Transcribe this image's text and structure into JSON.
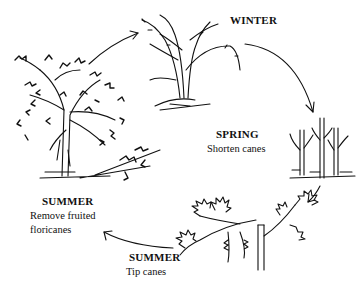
{
  "diagram": {
    "type": "cycle",
    "stages": [
      {
        "id": "winter",
        "title": "WINTER",
        "caption": ""
      },
      {
        "id": "spring",
        "title": "SPRING",
        "caption": "Shorten canes"
      },
      {
        "id": "summer-tip",
        "title": "SUMMER",
        "caption": "Tip canes"
      },
      {
        "id": "summer-remove",
        "title": "SUMMER",
        "caption_line1": "Remove fruited",
        "caption_line2": "floricanes"
      }
    ],
    "arrows": [
      {
        "from": "summer-remove",
        "to": "winter"
      },
      {
        "from": "winter",
        "to": "spring"
      },
      {
        "from": "spring",
        "to": "summer-tip"
      },
      {
        "from": "summer-tip",
        "to": "summer-remove"
      }
    ],
    "line_color": "#111111",
    "background": "#ffffff"
  }
}
